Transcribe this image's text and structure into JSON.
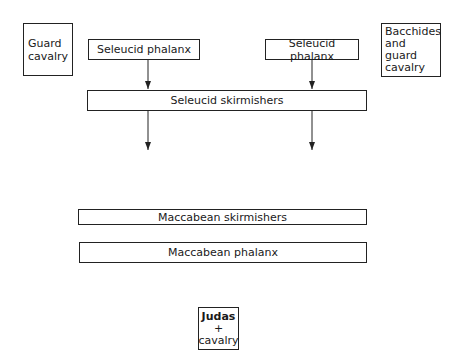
{
  "diagram": {
    "seleucid": {
      "guard_cavalry": "Guard cavalry",
      "phalanx_left": "Seleucid phalanx",
      "phalanx_right": "Seleucid phalanx",
      "bacchides": "Bacchides and guard cavalry",
      "skirmishers": "Seleucid skirmishers"
    },
    "maccabean": {
      "skirmishers": "Maccabean skirmishers",
      "phalanx": "Maccabean phalanx",
      "judas_line1": "Judas",
      "judas_line2": "+",
      "judas_line3": "cavalry"
    },
    "arrows": [
      {
        "from": "phalanx_left",
        "to": "skirmishers",
        "x": 148
      },
      {
        "from": "phalanx_right",
        "to": "skirmishers",
        "x": 312
      },
      {
        "from": "skirmishers",
        "direction": "down",
        "x": 148
      },
      {
        "from": "skirmishers",
        "direction": "down",
        "x": 312
      }
    ],
    "line_color": "#222222"
  }
}
